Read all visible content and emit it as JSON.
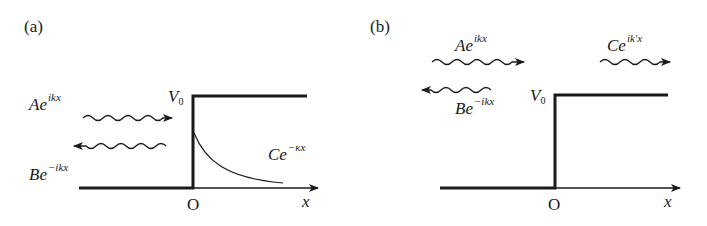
{
  "panels": [
    {
      "id": "a",
      "label": "(a)",
      "description": "Potential step with energy below V0: incident and reflected waves, evanescent decay",
      "potential_label": {
        "base": "V",
        "sub": "0"
      },
      "origin_label": "O",
      "axis_label": "x",
      "waves": [
        {
          "name": "incident",
          "base": "Ae",
          "exp": "ikx",
          "direction": "right"
        },
        {
          "name": "reflected",
          "base": "Be",
          "exp": "−ikx",
          "direction": "left"
        },
        {
          "name": "evanescent",
          "base": "Ce",
          "exp": "−κx",
          "shape": "exponential-decay"
        }
      ]
    },
    {
      "id": "b",
      "label": "(b)",
      "description": "Potential step with energy above V0: incident, reflected and transmitted waves",
      "potential_label": {
        "base": "V",
        "sub": "0"
      },
      "origin_label": "O",
      "axis_label": "x",
      "waves": [
        {
          "name": "incident",
          "base": "Ae",
          "exp": "ikx",
          "direction": "right"
        },
        {
          "name": "reflected",
          "base": "Be",
          "exp": "−ikx",
          "direction": "left"
        },
        {
          "name": "transmitted",
          "base": "Ce",
          "exp": "ik′x",
          "direction": "right"
        }
      ]
    }
  ],
  "colors": {
    "line": "#1a1a1a",
    "background": "#ffffff"
  }
}
